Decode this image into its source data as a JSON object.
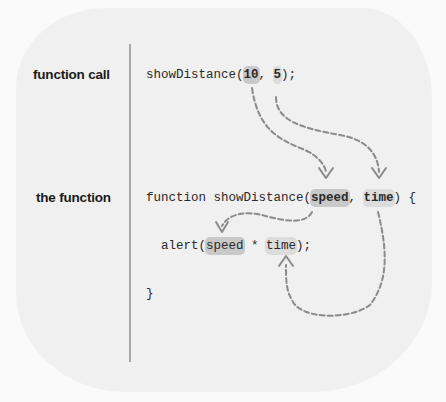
{
  "labels": {
    "call": "function call",
    "definition": "the function"
  },
  "code": {
    "call": {
      "prefix": "showDistance(",
      "arg1": "10",
      "sep": ", ",
      "arg2": "5",
      "suffix": ");"
    },
    "definition": {
      "prefix": "function showDistance(",
      "param1": "speed",
      "sep": ", ",
      "param2": "time",
      "suffix": ") {"
    },
    "body": {
      "indent": "  ",
      "prefix": "alert(",
      "use1": "speed",
      "op": " * ",
      "use2": "time",
      "suffix": ");"
    },
    "closing": "}"
  },
  "colors": {
    "background": "#fafafa",
    "blob": "#f0f0f0",
    "divider": "#a8a8a8",
    "arrow": "#8a8a8a",
    "highlight_dark": "#c9c9c9",
    "highlight_light": "#dcdcdc"
  }
}
